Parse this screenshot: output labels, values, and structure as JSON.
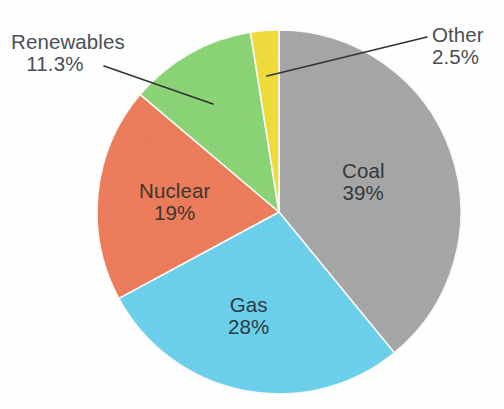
{
  "chart_data": {
    "type": "pie",
    "title": "",
    "subtitle": "",
    "xlabel": "",
    "ylabel": "",
    "legend_position": "none",
    "grid": false,
    "background_color": "#fdfdfd",
    "label_text_color": "#3b3f47",
    "leader_line_color": "#303438",
    "center": {
      "x": 279,
      "y": 212
    },
    "radius": 182,
    "start_angle_deg": 0,
    "direction": "clockwise",
    "categories": [
      "Coal",
      "Gas",
      "Nuclear",
      "Renewables",
      "Other"
    ],
    "values": [
      39,
      28,
      19,
      11.3,
      2.5
    ],
    "slices": [
      {
        "name": "Coal",
        "label": "Coal",
        "value": 39,
        "value_label": "39%",
        "color": "#ababab",
        "label_placement": "inside",
        "label_x": 370,
        "label_y": 175
      },
      {
        "name": "Gas",
        "label": "Gas",
        "value": 28,
        "value_label": "28%",
        "color": "#6fd6f2",
        "label_placement": "inside",
        "label_x": 256,
        "label_y": 310
      },
      {
        "name": "Nuclear",
        "label": "Nuclear",
        "value": 19,
        "value_label": "19%",
        "color": "#f2805e",
        "label_placement": "inside",
        "label_x": 180,
        "label_y": 196
      },
      {
        "name": "Renewables",
        "label": "Renewables",
        "value": 11.3,
        "value_label": "11.3%",
        "color": "#8fd97a",
        "label_placement": "outside",
        "label_x": 13,
        "label_y": 42,
        "leader_from_x": 104,
        "leader_from_y": 66,
        "leader_to_x": 213,
        "leader_to_y": 104
      },
      {
        "name": "Other",
        "label": "Other",
        "value": 2.5,
        "value_label": "2.5%",
        "color": "#f5e23c",
        "label_placement": "outside",
        "label_x": 433,
        "label_y": 33,
        "leader_from_x": 427,
        "leader_from_y": 37,
        "leader_to_x": 267,
        "leader_to_y": 76
      }
    ]
  }
}
